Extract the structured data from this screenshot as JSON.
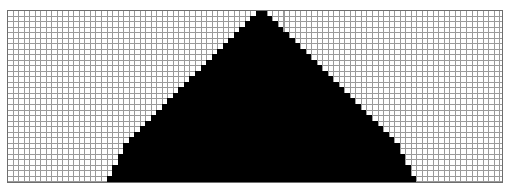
{
  "figure": {
    "canvas_width": 510,
    "canvas_height": 194,
    "background_color": "#ffffff"
  },
  "grid": {
    "name": "graph-paper",
    "left": 7,
    "top": 10,
    "width": 496,
    "height": 173,
    "cell_size": 5.53,
    "columns": 90,
    "rows": 31,
    "line_color": "#9a9a9a",
    "line_width": 1,
    "border_color": "#6e6e6e",
    "border_width": 1,
    "fill_color": "#ffffff"
  },
  "shape": {
    "name": "triangle",
    "type": "isosceles-triangle",
    "rendering": "aliased-staircase",
    "fill_color": "#000000",
    "apex_column": 45,
    "apex_row": 0,
    "base_row": 31,
    "base_left_column": 18,
    "base_right_column": 73,
    "slope_step_cells": 1,
    "rows": [
      {
        "row": 0,
        "start": 45,
        "end": 46
      },
      {
        "row": 1,
        "start": 44,
        "end": 47
      },
      {
        "row": 2,
        "start": 43,
        "end": 48
      },
      {
        "row": 3,
        "start": 42,
        "end": 49
      },
      {
        "row": 4,
        "start": 41,
        "end": 50
      },
      {
        "row": 5,
        "start": 40,
        "end": 51
      },
      {
        "row": 6,
        "start": 39,
        "end": 52
      },
      {
        "row": 7,
        "start": 38,
        "end": 53
      },
      {
        "row": 8,
        "start": 37,
        "end": 54
      },
      {
        "row": 9,
        "start": 36,
        "end": 55
      },
      {
        "row": 10,
        "start": 35,
        "end": 56
      },
      {
        "row": 11,
        "start": 34,
        "end": 57
      },
      {
        "row": 12,
        "start": 33,
        "end": 58
      },
      {
        "row": 13,
        "start": 32,
        "end": 59
      },
      {
        "row": 14,
        "start": 31,
        "end": 60
      },
      {
        "row": 15,
        "start": 30,
        "end": 61
      },
      {
        "row": 16,
        "start": 29,
        "end": 62
      },
      {
        "row": 17,
        "start": 28,
        "end": 63
      },
      {
        "row": 18,
        "start": 27,
        "end": 64
      },
      {
        "row": 19,
        "start": 26,
        "end": 65
      },
      {
        "row": 20,
        "start": 25,
        "end": 66
      },
      {
        "row": 21,
        "start": 24,
        "end": 67
      },
      {
        "row": 22,
        "start": 23,
        "end": 68
      },
      {
        "row": 23,
        "start": 22,
        "end": 69
      },
      {
        "row": 24,
        "start": 21,
        "end": 70
      },
      {
        "row": 25,
        "start": 21,
        "end": 70
      },
      {
        "row": 26,
        "start": 20,
        "end": 71
      },
      {
        "row": 27,
        "start": 20,
        "end": 71
      },
      {
        "row": 28,
        "start": 19,
        "end": 72
      },
      {
        "row": 29,
        "start": 19,
        "end": 72
      },
      {
        "row": 30,
        "start": 18,
        "end": 73
      }
    ]
  },
  "chart_data": {
    "type": "heatmap",
    "xlabel": "",
    "ylabel": "",
    "grid": true,
    "legend": "none",
    "columns": 90,
    "rows": 31,
    "filled_color": "#000000",
    "empty_color": "#ffffff"
  }
}
